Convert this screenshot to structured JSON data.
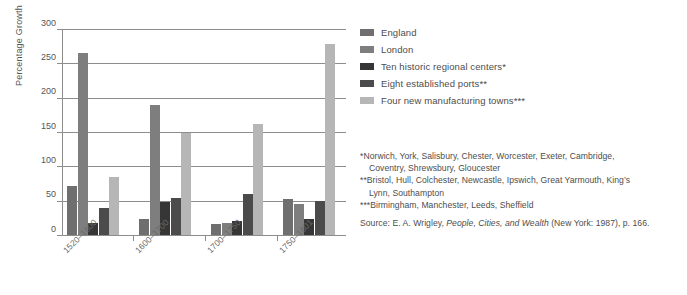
{
  "chart_data": {
    "type": "bar",
    "title": "",
    "subtitle": "",
    "xlabel": "",
    "ylabel": "Percentage Growth",
    "ylim": [
      0,
      300
    ],
    "yticks": [
      0,
      50,
      100,
      150,
      200,
      250,
      300
    ],
    "ytick_labels": [
      "0",
      "50",
      "100",
      "150",
      "200",
      "250",
      "300"
    ],
    "grid": true,
    "legend_position": "right",
    "categories": [
      "1520–1600",
      "1600–1700",
      "1700–1750",
      "1750–1801"
    ],
    "series": [
      {
        "name": "England",
        "color": "#6f6f6f",
        "values": [
          71,
          24,
          16,
          52
        ]
      },
      {
        "name": "London",
        "color": "#7e7e7e",
        "values": [
          265,
          189,
          18,
          45
        ]
      },
      {
        "name": "Ten historic regional centers*",
        "color": "#363636",
        "values": [
          18,
          48,
          21,
          24
        ]
      },
      {
        "name": "Eight established ports**",
        "color": "#4b4b4b",
        "values": [
          39,
          54,
          60,
          49
        ]
      },
      {
        "name": "Four new manufacturing towns***",
        "color": "#b6b6b6",
        "values": [
          84,
          148,
          161,
          278
        ]
      }
    ]
  },
  "legend": {
    "items": [
      {
        "label": "England",
        "color": "#6f6f6f"
      },
      {
        "label": "London",
        "color": "#7e7e7e"
      },
      {
        "label": "Ten historic regional centers*",
        "color": "#363636"
      },
      {
        "label": "Eight established ports**",
        "color": "#4b4b4b"
      },
      {
        "label": "Four new manufacturing towns***",
        "color": "#b6b6b6"
      }
    ]
  },
  "notes": {
    "footnote_1_line_1": "*Norwich, York, Salisbury, Chester, Worcester, Exeter, Cambridge,",
    "footnote_1_line_2": "Coventry, Shrewsbury, Gloucester",
    "footnote_2_line_1": "**Bristol, Hull, Colchester, Newcastle, Ipswich, Great Yarmouth, King’s",
    "footnote_2_line_2": "Lynn, Southampton",
    "footnote_3": "***Birmingham, Manchester, Leeds, Sheffield",
    "source_prefix": "Source: E. A. Wrigley, ",
    "source_title": "People, Cities, and Wealth",
    "source_suffix": " (New York: 1987), p. 166."
  }
}
